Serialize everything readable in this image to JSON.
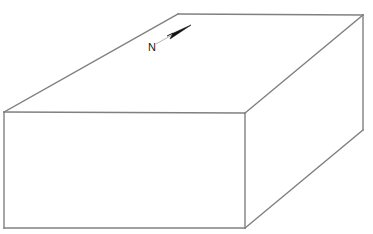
{
  "figure": {
    "name": "block-diagram",
    "background_color": "#ffffff",
    "line_color": "#808080",
    "fill_color": "#ffffff",
    "arrow_color": "#111111",
    "leader_color": "#b4b4b4"
  },
  "annotations": {
    "north_label": "N"
  },
  "geometry": {
    "top_face_points": "4,112 178,14 363,15 245,113",
    "front_face_points": "4,112 245,113 245,228 4,228",
    "right_face_points": "245,113 363,15 363,130 245,228",
    "edges": {
      "top_back_left": "4,112 178,14",
      "top_back_right": "178,14 363,15",
      "top_front_right": "363,15 245,113",
      "top_front_left": "245,113 4,112",
      "front_left_vertical": "4,112 4,228",
      "front_right_vertical": "245,113 245,228",
      "front_bottom": "4,228 245,228",
      "right_vertical": "363,15 363,130",
      "right_bottom": "363,130 245,228"
    },
    "north_arrow": {
      "triangle_points": "191,25 167,36 173,33 170,39",
      "leader_line": "156,44 172,35",
      "label_x": 148,
      "label_y": 51
    }
  }
}
